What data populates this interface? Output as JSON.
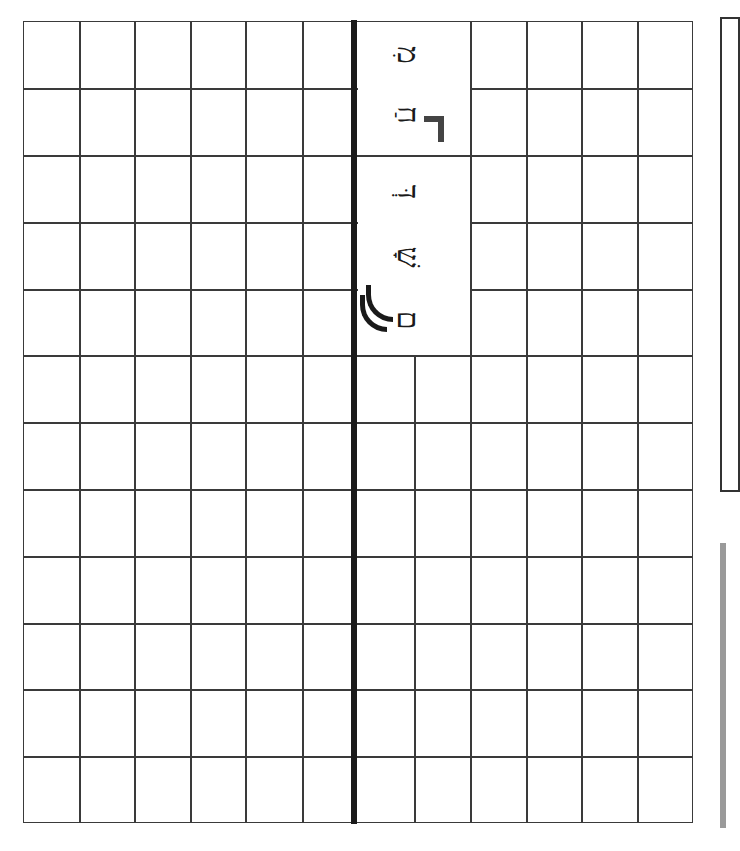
{
  "worksheet": {
    "grid": {
      "rows": 12,
      "columns_left": 6,
      "columns_right": 6,
      "line_color": "#3a3a3a",
      "divider_color": "#1a1a1a"
    },
    "vertical_text": {
      "orientation": "rotated-90",
      "cells": [
        {
          "glyphs": [
            "מִ",
            "חַ"
          ],
          "marker": "corner-bracket"
        },
        {
          "glyphs": [
            "דְּ",
            "שָׁ",
            "ם"
          ],
          "mark": "double-arc"
        }
      ]
    }
  },
  "side_panel": {
    "border_color": "#333333"
  },
  "side_bar": {
    "color": "#9a9a9a"
  }
}
